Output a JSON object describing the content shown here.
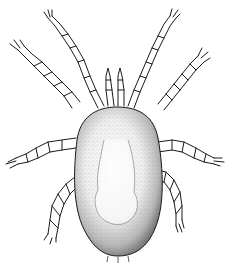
{
  "figure": {
    "style": "stippled line illustration, dorsal view",
    "colors": {
      "ink": "#1a1a1a",
      "background": "#ffffff",
      "stipple": "#555555"
    },
    "parts": {
      "body": "oval idiosoma",
      "legs": 8,
      "palps": 2
    },
    "caption": ""
  }
}
